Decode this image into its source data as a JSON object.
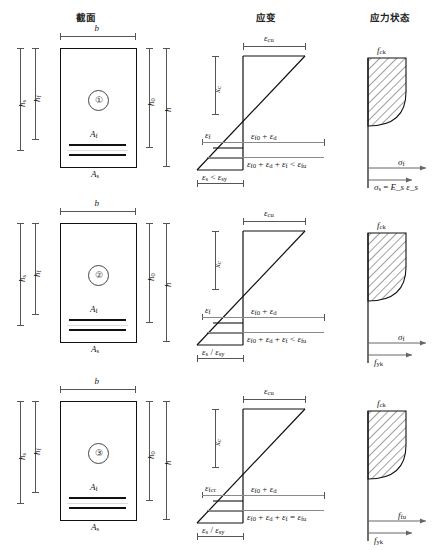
{
  "headers": {
    "section": "截面",
    "strain": "应变",
    "stress": "应力状态"
  },
  "symbols": {
    "b": "b",
    "h": "h",
    "h0": "h₀",
    "hf": "h_f",
    "hs": "h_s",
    "Af": "A_f",
    "As": "A_s",
    "xc": "x_c",
    "eps_cu": "ε_cu",
    "f_ck": "f_ck",
    "sigma_f": "σ_f",
    "f_fu": "f_fu",
    "f_yk": "f_yk"
  },
  "rows": [
    {
      "id": "1",
      "marker": "①",
      "section": {
        "top_dim": "b",
        "left_outer": "h",
        "left_outer_sub": "s",
        "left_inner": "h",
        "left_inner_sub": "f",
        "right_inner": "h",
        "right_inner_sub": "0",
        "right_outer": "h",
        "frp_label": "A",
        "frp_sub": "f",
        "steel_label": "A",
        "steel_sub": "s"
      },
      "strain": {
        "top": "ε",
        "top_sub": "cu",
        "depth": "x",
        "depth_sub": "c",
        "frp_strain": "ε",
        "frp_strain_sub": "f",
        "mid_right": "ε_f0 + ε_d",
        "low_right": "ε_f0 + ε_d + ε_f < ε_fu",
        "bottom": "ε_s < ε_sy"
      },
      "stress": {
        "concrete": "f_ck",
        "upper_arrow": "σ_f",
        "lower_arrow": "σ_s = E_s ε_s"
      }
    },
    {
      "id": "2",
      "marker": "②",
      "section": {
        "top_dim": "b",
        "left_outer": "h",
        "left_outer_sub": "s",
        "left_inner": "h",
        "left_inner_sub": "f",
        "right_inner": "h",
        "right_inner_sub": "0",
        "right_outer": "h",
        "frp_label": "A",
        "frp_sub": "f",
        "steel_label": "A",
        "steel_sub": "s"
      },
      "strain": {
        "top": "ε",
        "top_sub": "cu",
        "depth": "x",
        "depth_sub": "c",
        "frp_strain": "ε",
        "frp_strain_sub": "f",
        "mid_right": "ε_f0 + ε_d",
        "low_right": "ε_f0 + ε_d + ε_f < ε_fu",
        "bottom": "ε_s / ε_sy"
      },
      "stress": {
        "concrete": "f_ck",
        "upper_arrow": "σ_f",
        "lower_arrow": "f_yk"
      }
    },
    {
      "id": "3",
      "marker": "③",
      "section": {
        "top_dim": "b",
        "left_outer": "h",
        "left_outer_sub": "s",
        "left_inner": "h",
        "left_inner_sub": "f",
        "right_inner": "h",
        "right_inner_sub": "0",
        "right_outer": "h",
        "frp_label": "A",
        "frp_sub": "f",
        "steel_label": "A",
        "steel_sub": "s"
      },
      "strain": {
        "top": "ε",
        "top_sub": "cu",
        "depth": "x",
        "depth_sub": "c",
        "frp_strain": "ε",
        "frp_strain_sub": "fcr",
        "mid_right": "ε_f0 + ε_d",
        "low_right": "ε_f0 + ε_d + ε_f = ε_fu",
        "bottom": "ε_s / ε_sy"
      },
      "stress": {
        "concrete": "f_ck",
        "upper_arrow": "f_fu",
        "lower_arrow": "f_yk"
      }
    }
  ],
  "colors": {
    "line": "#111111",
    "dim": "#555555",
    "background": "#ffffff"
  }
}
